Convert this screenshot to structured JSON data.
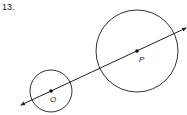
{
  "problem": {
    "number": "13."
  },
  "diagram": {
    "circles": [
      {
        "name": "O",
        "center": [
          51,
          91
        ],
        "radius": 21
      },
      {
        "name": "P",
        "center": [
          137,
          51
        ],
        "radius": 41
      }
    ],
    "line": {
      "from": [
        21,
        105
      ],
      "to": [
        186,
        28
      ],
      "arrows": "both"
    },
    "labels": {
      "O": "O",
      "P": "P"
    },
    "colors": {
      "stroke": "#333333",
      "point": "#111111"
    }
  }
}
